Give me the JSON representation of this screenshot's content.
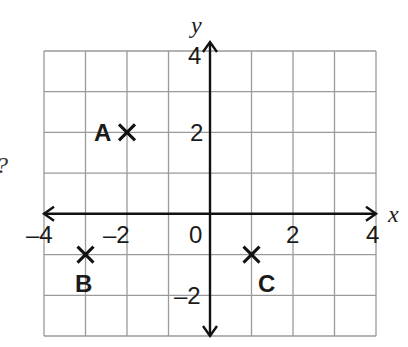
{
  "figure": {
    "side_text": "?",
    "axes": {
      "x_label": "x",
      "y_label": "y",
      "x_range": [
        -4,
        4
      ],
      "y_range": [
        -3,
        4
      ],
      "x_tick_labels": [
        "–4",
        "–2",
        "0",
        "2",
        "4"
      ],
      "y_tick_labels": [
        "4",
        "2",
        "–2"
      ]
    },
    "points": [
      {
        "label": "A",
        "x": -2,
        "y": 2
      },
      {
        "label": "B",
        "x": -3,
        "y": -1
      },
      {
        "label": "C",
        "x": 1,
        "y": -1
      }
    ],
    "colors": {
      "grid": "#9a9a9a",
      "axis": "#111111",
      "background": "#ffffff"
    }
  }
}
